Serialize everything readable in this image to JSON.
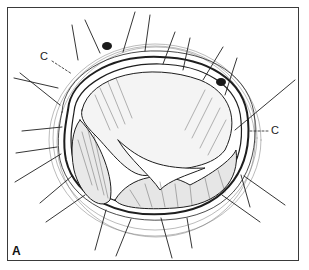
{
  "figure": {
    "panel_label": "A",
    "callouts": [
      {
        "text": "C",
        "side": "upper-left"
      },
      {
        "text": "C",
        "side": "right"
      }
    ],
    "colors": {
      "ink": "#1e1e1e",
      "frame": "#3a3a3a",
      "background": "#ffffff"
    }
  }
}
